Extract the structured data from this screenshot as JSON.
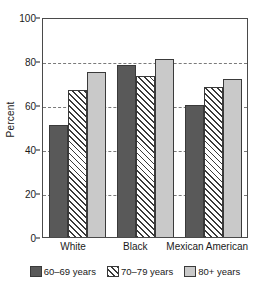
{
  "chart_data": {
    "type": "bar",
    "title": "",
    "xlabel": "",
    "ylabel": "Percent",
    "ylim": [
      0,
      100
    ],
    "yticks": [
      0,
      20,
      40,
      60,
      80,
      100
    ],
    "ytick_labels": [
      "0",
      "20",
      "40",
      "60",
      "80",
      "100"
    ],
    "grid": "horizontal-dashed",
    "legend_position": "bottom",
    "categories": [
      "White",
      "Black",
      "Mexican American"
    ],
    "series": [
      {
        "name": "60–69 years",
        "pattern": "dark",
        "color": "#595959",
        "values": [
          51,
          78,
          60
        ]
      },
      {
        "name": "70–79 years",
        "pattern": "hatch",
        "color": "#ffffff",
        "values": [
          67,
          73,
          68
        ]
      },
      {
        "name": "80+ years",
        "pattern": "light",
        "color": "#c9c9c9",
        "values": [
          75,
          81,
          72
        ]
      }
    ]
  },
  "axis": {
    "y_title": "Percent",
    "y_ticks": [
      "100",
      "80",
      "60",
      "40",
      "20",
      "0"
    ],
    "x_labels": [
      "White",
      "Black",
      "Mexican American"
    ]
  },
  "legend": {
    "items": [
      {
        "label": "60–69 years",
        "swatch": "dark-swatch"
      },
      {
        "label": "70–79 years",
        "swatch": "hatched-swatch"
      },
      {
        "label": "80+ years",
        "swatch": "light-swatch"
      }
    ]
  },
  "colors": {
    "dark": "#595959",
    "light": "#c9c9c9",
    "hatch_line": "#3a3a3a",
    "axis": "#4a4a4a",
    "gridline": "#7a7a7a",
    "background": "#ffffff"
  }
}
